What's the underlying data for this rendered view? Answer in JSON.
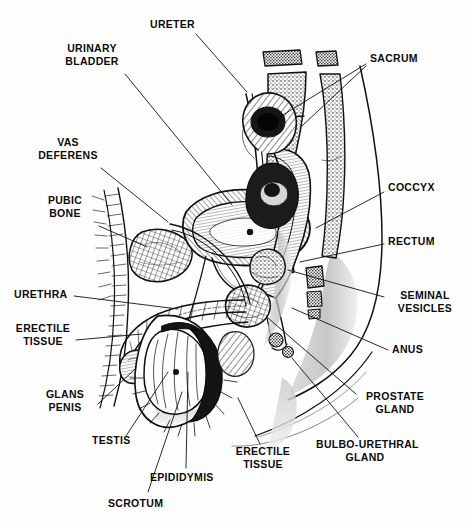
{
  "figure": {
    "kind": "anatomical-line-drawing",
    "width": 473,
    "height": 523,
    "background_color": "#ffffff",
    "ink_color": "#111111",
    "label_color": "#0b0b0b"
  },
  "labels": [
    {
      "id": "ureter",
      "text": "URETER",
      "align": "left",
      "x": 150,
      "y": 18,
      "anchor_x": 194,
      "anchor_y": 33,
      "leader": [
        [
          196,
          34
        ],
        [
          247,
          92
        ]
      ]
    },
    {
      "id": "urinary-bladder",
      "text": "URINARY\nBLADDER",
      "align": "center",
      "x": 58,
      "y": 42,
      "anchor_x": 123,
      "anchor_y": 72,
      "leader": [
        [
          125,
          74
        ],
        [
          232,
          205
        ]
      ]
    },
    {
      "id": "sacrum",
      "text": "SACRUM",
      "align": "left",
      "x": 370,
      "y": 52,
      "anchor_x": 368,
      "anchor_y": 62,
      "leader": [
        [
          366,
          64
        ],
        [
          278,
          118
        ]
      ],
      "leader2": [
        [
          366,
          64
        ],
        [
          300,
          124
        ]
      ]
    },
    {
      "id": "vas-deferens",
      "text": "VAS\nDEFERENS",
      "align": "center",
      "x": 36,
      "y": 136,
      "anchor_x": 100,
      "anchor_y": 166,
      "leader": [
        [
          101,
          168
        ],
        [
          168,
          222
        ]
      ]
    },
    {
      "id": "coccyx",
      "text": "COCCYX",
      "align": "left",
      "x": 388,
      "y": 181,
      "anchor_x": 386,
      "anchor_y": 189,
      "leader": [
        [
          384,
          192
        ],
        [
          318,
          228
        ]
      ]
    },
    {
      "id": "pubic-bone",
      "text": "PUBIC\nBONE",
      "align": "center",
      "x": 34,
      "y": 194,
      "anchor_x": 98,
      "anchor_y": 224,
      "leader": [
        [
          99,
          226
        ],
        [
          146,
          246
        ]
      ]
    },
    {
      "id": "rectum",
      "text": "RECTUM",
      "align": "left",
      "x": 388,
      "y": 235,
      "anchor_x": 386,
      "anchor_y": 243,
      "leader": [
        [
          384,
          244
        ],
        [
          302,
          262
        ]
      ]
    },
    {
      "id": "urethra",
      "text": "URETHRA",
      "align": "left",
      "x": 14,
      "y": 288,
      "anchor_x": 72,
      "anchor_y": 294,
      "leader": [
        [
          74,
          296
        ],
        [
          175,
          308
        ]
      ]
    },
    {
      "id": "seminal-vesicles",
      "text": "SEMINAL\nVESICLES",
      "align": "left",
      "x": 388,
      "y": 289,
      "anchor_x": 386,
      "anchor_y": 296,
      "leader": [
        [
          384,
          297
        ],
        [
          288,
          270
        ]
      ]
    },
    {
      "id": "erectile-tissue-l",
      "text": "ERECTILE\nTISSUE",
      "align": "center",
      "x": 12,
      "y": 322,
      "anchor_x": 74,
      "anchor_y": 338,
      "leader": [
        [
          76,
          340
        ],
        [
          140,
          334
        ]
      ]
    },
    {
      "id": "anus",
      "text": "ANUS",
      "align": "left",
      "x": 392,
      "y": 343,
      "anchor_x": 390,
      "anchor_y": 350,
      "leader": [
        [
          388,
          350
        ],
        [
          300,
          312
        ]
      ]
    },
    {
      "id": "glans-penis",
      "text": "GLANS\nPENIS",
      "align": "center",
      "x": 36,
      "y": 388,
      "anchor_x": 96,
      "anchor_y": 404,
      "leader": [
        [
          98,
          404
        ],
        [
          136,
          368
        ]
      ]
    },
    {
      "id": "prostate-gland",
      "text": "PROSTATE\nGLAND",
      "align": "center",
      "x": 360,
      "y": 390,
      "anchor_x": 358,
      "anchor_y": 397,
      "leader": [
        [
          356,
          394
        ],
        [
          277,
          322
        ]
      ]
    },
    {
      "id": "testis",
      "text": "TESTIS",
      "align": "left",
      "x": 92,
      "y": 434,
      "anchor_x": 124,
      "anchor_y": 440,
      "leader": [
        [
          126,
          436
        ],
        [
          166,
          374
        ]
      ]
    },
    {
      "id": "erectile-tissue-b",
      "text": "ERECTILE\nTISSUE",
      "align": "center",
      "x": 232,
      "y": 445,
      "anchor_x": 262,
      "anchor_y": 445,
      "leader": [
        [
          260,
          444
        ],
        [
          239,
          400
        ]
      ]
    },
    {
      "id": "bulbo-urethral",
      "text": "BULBO-URETHRAL\nGLAND",
      "align": "center",
      "x": 318,
      "y": 438,
      "anchor_x": 362,
      "anchor_y": 440,
      "leader": [
        [
          358,
          437
        ],
        [
          306,
          376
        ]
      ]
    },
    {
      "id": "epididymis",
      "text": "EPIDIDYMIS",
      "align": "left",
      "x": 150,
      "y": 471,
      "anchor_x": 184,
      "anchor_y": 470,
      "leader": [
        [
          186,
          468
        ],
        [
          186,
          372
        ]
      ]
    },
    {
      "id": "scrotum",
      "text": "SCROTUM",
      "align": "left",
      "x": 108,
      "y": 497,
      "anchor_x": 146,
      "anchor_y": 496,
      "leader": [
        [
          148,
          492
        ],
        [
          180,
          392
        ]
      ]
    }
  ],
  "structures": [
    {
      "id": "sacrum-vertebrae",
      "name": "sacrum",
      "note": "stippled wedge-shaped vertebral bodies upper right"
    },
    {
      "id": "coccyx-bone",
      "name": "coccyx",
      "note": "small stippled segments below sacrum"
    },
    {
      "id": "urinary-bladder-s",
      "name": "urinary bladder",
      "note": "large hatched dome in centre"
    },
    {
      "id": "pubic-bone-s",
      "name": "pubic bone",
      "note": "cross-hatched oval left of bladder"
    },
    {
      "id": "rectum-s",
      "name": "rectum",
      "note": "shaded tube curving down right"
    },
    {
      "id": "prostate-s",
      "name": "prostate gland",
      "note": "dense clustered mass beneath bladder"
    },
    {
      "id": "seminal-ves-s",
      "name": "seminal vesicles",
      "note": "lobulated sac behind bladder"
    },
    {
      "id": "penis-shaft",
      "name": "penis with erectile tissue",
      "note": "hatched shaft running left-down"
    },
    {
      "id": "testis-s",
      "name": "testis",
      "note": "oval body in scrotum"
    },
    {
      "id": "epididymis-s",
      "name": "epididymis",
      "note": "dark crescent over testis"
    },
    {
      "id": "scrotum-s",
      "name": "scrotum",
      "note": "shaded sac enclosing testis"
    },
    {
      "id": "body-outline",
      "name": "body contour",
      "note": "long sweeping outline of buttock and thigh"
    }
  ]
}
